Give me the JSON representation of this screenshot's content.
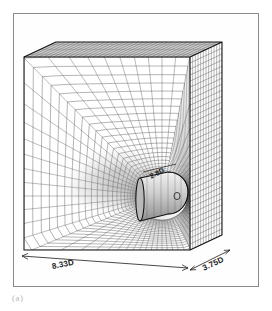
{
  "figure": {
    "caption": "(a)",
    "frame_color": "#8a8a8a",
    "background": "#ffffff"
  },
  "labels": {
    "length": "8.33D",
    "depth": "3.75D",
    "cylinder": "2.8D"
  },
  "chart_data": {
    "type": "diagram",
    "subtitle": "(a)",
    "view": "axonometric 3D block mesh",
    "annotations": [
      {
        "name": "streamwise-length",
        "text": "8.33D",
        "value": 8.33,
        "unit": "D",
        "edge": "bottom-front-horizontal"
      },
      {
        "name": "spanwise-depth",
        "text": "3.75D",
        "value": 3.75,
        "unit": "D",
        "edge": "bottom-right-receding"
      },
      {
        "name": "cylinder-length",
        "text": "2.8D",
        "value": 2.8,
        "unit": "D",
        "edge": "cylinder-axis"
      }
    ],
    "mesh": {
      "front_face_cols": 34,
      "front_face_rows": 32,
      "top_face_rows": 12,
      "side_face_cols": 12,
      "refinement": "radial clustering toward cylinder, wake refinement upstream-left",
      "line_color": "#3a3a3a",
      "grid": true
    },
    "geometry": {
      "block": "rectangular box",
      "object": "circular cylinder with rounded downstream cap",
      "object_position": "right-of-center on front face"
    },
    "xlabel": "",
    "ylabel": "",
    "legend": "none"
  }
}
